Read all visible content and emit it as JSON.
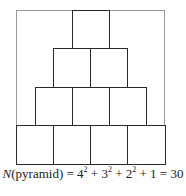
{
  "diagram": {
    "rows": [
      {
        "level": 1,
        "count": 1
      },
      {
        "level": 2,
        "count": 2
      },
      {
        "level": 3,
        "count": 3
      },
      {
        "level": 4,
        "count": 4
      }
    ],
    "colors": {
      "block_border": "#2a2a2a",
      "frame": "#9a9a9a",
      "background": "#ffffff"
    }
  },
  "caption": {
    "var": "N",
    "arg": "(pyramid) = 4",
    "t1": " + 3",
    "t2": " + 2",
    "t3": " + 1 = 30",
    "exp": "2"
  }
}
